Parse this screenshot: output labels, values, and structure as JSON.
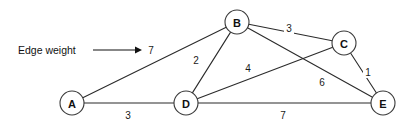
{
  "figure": {
    "width": 413,
    "height": 130,
    "background_color": "#ffffff",
    "line_color": "#2b2b2b",
    "text_color": "#111111"
  },
  "annotation": {
    "label": "Edge weight",
    "arrow_points_to": "7",
    "arrow": {
      "x1": 93,
      "y1": 50,
      "x2": 140,
      "y2": 50
    },
    "label_x": 18,
    "label_y": 50
  },
  "chart_data": {
    "type": "diagram",
    "graph_type": "weighted-undirected-graph",
    "title": "",
    "nodes": [
      {
        "id": "A",
        "label": "A",
        "x": 72,
        "y": 103,
        "r": 12
      },
      {
        "id": "B",
        "label": "B",
        "x": 237,
        "y": 22,
        "r": 12
      },
      {
        "id": "C",
        "label": "C",
        "x": 344,
        "y": 43,
        "r": 12
      },
      {
        "id": "D",
        "label": "D",
        "x": 186,
        "y": 103,
        "r": 12
      },
      {
        "id": "E",
        "label": "E",
        "x": 383,
        "y": 103,
        "r": 12
      }
    ],
    "edges": [
      {
        "id": "A-B",
        "source": "A",
        "target": "B",
        "weight": 7,
        "label_x": 151,
        "label_y": 50
      },
      {
        "id": "A-D",
        "source": "A",
        "target": "D",
        "weight": 3,
        "label_x": 128,
        "label_y": 115
      },
      {
        "id": "B-D",
        "source": "B",
        "target": "D",
        "weight": 2,
        "label_x": 196,
        "label_y": 60
      },
      {
        "id": "B-C",
        "source": "B",
        "target": "C",
        "weight": 3,
        "label_x": 289,
        "label_y": 28
      },
      {
        "id": "B-E",
        "source": "B",
        "target": "E",
        "weight": 6,
        "label_x": 322,
        "label_y": 82
      },
      {
        "id": "D-C",
        "source": "D",
        "target": "C",
        "weight": 4,
        "label_x": 248,
        "label_y": 68
      },
      {
        "id": "D-E",
        "source": "D",
        "target": "E",
        "weight": 7,
        "label_x": 283,
        "label_y": 115
      },
      {
        "id": "C-E",
        "source": "C",
        "target": "E",
        "weight": 1,
        "label_x": 368,
        "label_y": 72
      }
    ]
  }
}
